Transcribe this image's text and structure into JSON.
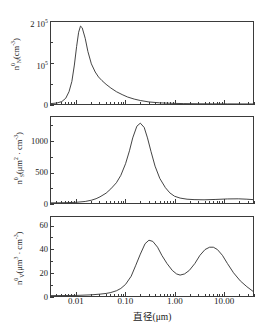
{
  "chart_data": [
    {
      "type": "line",
      "panel": 1,
      "ylabel_plain": "n0N(cm-3)",
      "ylabel_main": "n",
      "ylabel_sub": "N",
      "ylabel_sup": "0",
      "ylabel_unit": "(cm",
      "ylabel_unit_sup": "-3",
      "ylabel_unit_end": ")",
      "xlabel": "直径(μm)",
      "xscale": "log",
      "xlim": [
        0.003,
        40
      ],
      "ylim": [
        0,
        200000
      ],
      "grid": false,
      "legend": null,
      "ytick_labels": [
        "0",
        "10⁵",
        "2 10⁵"
      ],
      "ytick_values": [
        0,
        100000,
        200000
      ],
      "ytick_label_html": [
        "0",
        "10<sup>5</sup>",
        "2 10<sup>5</sup>"
      ],
      "x": [
        0.003,
        0.004,
        0.005,
        0.006,
        0.007,
        0.008,
        0.009,
        0.01,
        0.011,
        0.012,
        0.013,
        0.015,
        0.017,
        0.02,
        0.024,
        0.028,
        0.033,
        0.04,
        0.05,
        0.065,
        0.085,
        0.11,
        0.15,
        0.2,
        0.3,
        0.5,
        0.8,
        1.5,
        3.0,
        6.0,
        12.0,
        25.0,
        40.0
      ],
      "y": [
        1000,
        2500,
        6000,
        14000,
        30000,
        55000,
        95000,
        140000,
        175000,
        190000,
        186000,
        160000,
        128000,
        98000,
        78000,
        66000,
        57000,
        48000,
        39000,
        30000,
        23000,
        17000,
        12000,
        8500,
        5000,
        2800,
        1800,
        1000,
        600,
        400,
        300,
        200,
        150
      ]
    },
    {
      "type": "line",
      "panel": 2,
      "ylabel_plain": "n0S(um2 . cm-3)",
      "ylabel_main": "n",
      "ylabel_sub": "S",
      "ylabel_sup": "0",
      "ylabel_unit": "(μm",
      "ylabel_unit_sup": "2",
      "ylabel_unit_mid": " · cm",
      "ylabel_unit_sup2": "-3",
      "ylabel_unit_end": ")",
      "xlabel": "直径(μm)",
      "xscale": "log",
      "xlim": [
        0.003,
        40
      ],
      "ylim": [
        0,
        1400
      ],
      "grid": false,
      "legend": null,
      "ytick_labels": [
        "0",
        "500",
        "1000"
      ],
      "ytick_values": [
        0,
        500,
        1000
      ],
      "ytick_label_html": [
        "0",
        "500",
        "1000"
      ],
      "x": [
        0.003,
        0.006,
        0.01,
        0.015,
        0.02,
        0.025,
        0.03,
        0.04,
        0.05,
        0.065,
        0.08,
        0.1,
        0.12,
        0.14,
        0.17,
        0.2,
        0.24,
        0.28,
        0.33,
        0.4,
        0.5,
        0.65,
        0.8,
        1.0,
        1.3,
        1.8,
        2.5,
        4.0,
        7.0,
        12.0,
        20.0,
        30.0,
        40.0
      ],
      "y": [
        2,
        5,
        12,
        25,
        45,
        70,
        100,
        160,
        230,
        330,
        450,
        640,
        850,
        1060,
        1250,
        1300,
        1230,
        1060,
        840,
        600,
        400,
        250,
        165,
        110,
        80,
        62,
        55,
        52,
        58,
        66,
        68,
        62,
        55
      ]
    },
    {
      "type": "line",
      "panel": 3,
      "ylabel_plain": "n0V(um3 . cm-3)",
      "ylabel_main": "n",
      "ylabel_sub": "V",
      "ylabel_sup": "0",
      "ylabel_unit": "(μm",
      "ylabel_unit_sup": "3",
      "ylabel_unit_mid": " · cm",
      "ylabel_unit_sup2": "-3",
      "ylabel_unit_end": ")",
      "xlabel": "直径(μm)",
      "xscale": "log",
      "xlim": [
        0.003,
        40
      ],
      "ylim": [
        0,
        68
      ],
      "grid": false,
      "legend": null,
      "ytick_labels": [
        "0",
        "20",
        "40",
        "60"
      ],
      "ytick_values": [
        0,
        20,
        40,
        60
      ],
      "ytick_label_html": [
        "0",
        "20",
        "40",
        "60"
      ],
      "x": [
        0.003,
        0.01,
        0.02,
        0.03,
        0.04,
        0.05,
        0.065,
        0.08,
        0.1,
        0.13,
        0.16,
        0.2,
        0.25,
        0.3,
        0.36,
        0.45,
        0.55,
        0.7,
        0.9,
        1.1,
        1.3,
        1.6,
        2.0,
        2.6,
        3.3,
        4.2,
        5.2,
        6.2,
        7.5,
        9.5,
        12.0,
        16.0,
        22.0,
        30.0,
        40.0
      ],
      "y": [
        0.3,
        0.5,
        1.0,
        1.6,
        2.2,
        3.0,
        4.5,
        6.5,
        10,
        17,
        26,
        36,
        45,
        48,
        47,
        42,
        35,
        28,
        22,
        19,
        18,
        19,
        22,
        28,
        35,
        40,
        42,
        42,
        40,
        35,
        28,
        20,
        13,
        8,
        4
      ]
    }
  ],
  "xaxis": {
    "tick_labels": [
      "0.01",
      "0.10",
      "1.00",
      "10.00"
    ],
    "tick_values": [
      0.01,
      0.1,
      1,
      10
    ],
    "title": "直径(μm)",
    "scale": "log"
  },
  "colors": {
    "curve": "#2b2b2b",
    "axis": "#3b3b3b",
    "background": "#ffffff"
  }
}
